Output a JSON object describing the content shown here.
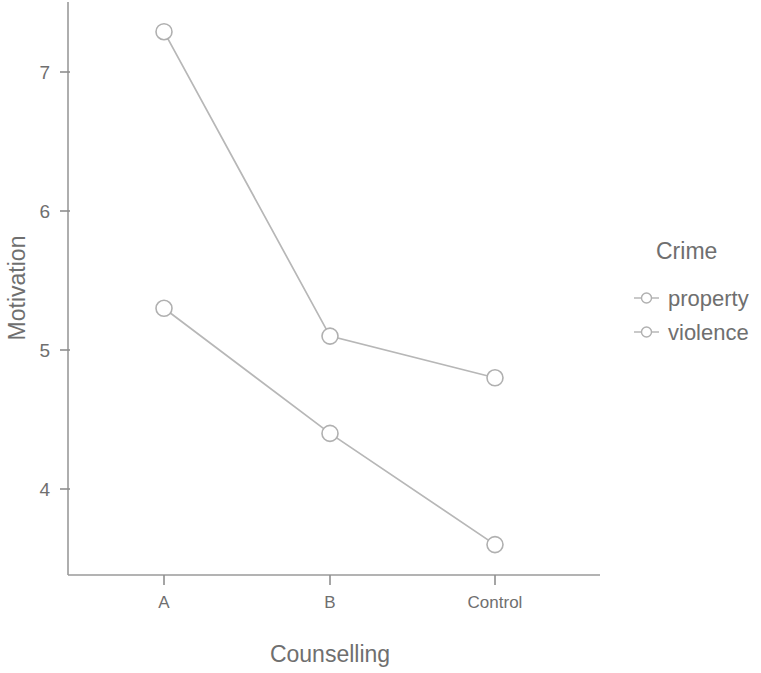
{
  "chart_data": {
    "type": "line",
    "title": "",
    "xlabel": "Counselling",
    "ylabel": "Motivation",
    "categories": [
      "A",
      "B",
      "Control"
    ],
    "series": [
      {
        "name": "property",
        "values": [
          7.29,
          5.1,
          4.8
        ]
      },
      {
        "name": "violence",
        "values": [
          5.3,
          4.4,
          3.6
        ]
      }
    ],
    "yticks": [
      4,
      5,
      6,
      7
    ],
    "ytick_labels": [
      "4",
      "5",
      "6",
      "7"
    ],
    "ylim": [
      3.35,
      7.5
    ],
    "grid": false,
    "legend": {
      "title": "Crime",
      "position": "right",
      "entries": [
        "property",
        "violence"
      ]
    },
    "marker": "open-circle",
    "line_color": "#b7b7b7",
    "marker_color": "#b0b0b0",
    "axis_color": "#9a9a9a",
    "text_color": "#6f6f6f"
  },
  "axes": {
    "y_title": "Motivation",
    "x_title": "Counselling",
    "y_tick_labels": [
      "7",
      "6",
      "5",
      "4"
    ],
    "x_tick_labels": [
      "A",
      "B",
      "Control"
    ]
  },
  "legend": {
    "title": "Crime",
    "items": [
      {
        "label": "property"
      },
      {
        "label": "violence"
      }
    ]
  }
}
